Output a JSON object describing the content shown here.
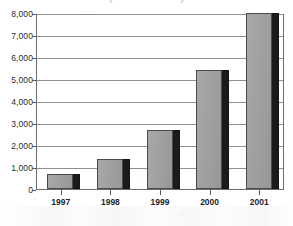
{
  "title_remnant": "(in thousands)",
  "chart_data": {
    "type": "bar",
    "title": "",
    "xlabel": "",
    "ylabel": "",
    "categories": [
      "1997",
      "1998",
      "1999",
      "2000",
      "2001"
    ],
    "values": [
      700,
      1350,
      2700,
      5400,
      8000
    ],
    "ylim": [
      0,
      8000
    ],
    "ytick_values": [
      0,
      1000,
      2000,
      3000,
      4000,
      5000,
      6000,
      7000,
      8000
    ],
    "ytick_labels": [
      "0",
      "1,000",
      "2,000",
      "3,000",
      "4,000",
      "5,000",
      "6,000",
      "7,000",
      "8,000"
    ],
    "grid": true,
    "legend": "none",
    "bar_color": "#9e9e9e",
    "bar_edge_color": "#4a4a4a",
    "bar_shadow_color": "#1b1b1b",
    "gridline_color": "#8f8f8f",
    "frame_color": "#6d6d6d",
    "text_color": "#1f1f1f"
  }
}
